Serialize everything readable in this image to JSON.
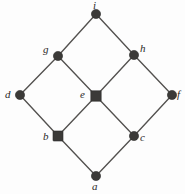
{
  "figure": {
    "width": 185,
    "height": 194,
    "background_color": "#fdfdfd",
    "edge_color": "#53514f",
    "node_color": "#3b3a38",
    "label_color": "#2b2a28"
  },
  "chart_data": {
    "type": "diagram",
    "subtype": "hasse-diagram",
    "title": "",
    "xlabel": "",
    "ylabel": "",
    "grid": false,
    "legend": null,
    "nodes": [
      {
        "id": "i",
        "label": "i",
        "x": 96,
        "y": 14,
        "shape": "circle",
        "radius": 4.6,
        "label_pos": "above",
        "label_x": 93,
        "label_y": 0
      },
      {
        "id": "g",
        "label": "g",
        "x": 58,
        "y": 56,
        "shape": "circle",
        "radius": 4.6,
        "label_pos": "left",
        "label_x": 43,
        "label_y": 44
      },
      {
        "id": "h",
        "label": "h",
        "x": 134,
        "y": 55,
        "shape": "circle",
        "radius": 4.6,
        "label_pos": "right",
        "label_x": 140,
        "label_y": 43
      },
      {
        "id": "d",
        "label": "d",
        "x": 20,
        "y": 95,
        "shape": "circle",
        "radius": 4.6,
        "label_pos": "left",
        "label_x": 5,
        "label_y": 89
      },
      {
        "id": "e",
        "label": "e",
        "x": 96,
        "y": 96,
        "shape": "square",
        "radius": 5.2,
        "label_pos": "left",
        "label_x": 80,
        "label_y": 89
      },
      {
        "id": "f",
        "label": "f",
        "x": 172,
        "y": 95,
        "shape": "circle",
        "radius": 4.6,
        "label_pos": "right",
        "label_x": 177,
        "label_y": 89
      },
      {
        "id": "b",
        "label": "b",
        "x": 58,
        "y": 136,
        "shape": "square",
        "radius": 5.0,
        "label_pos": "left",
        "label_x": 43,
        "label_y": 131
      },
      {
        "id": "c",
        "label": "c",
        "x": 134,
        "y": 136,
        "shape": "circle",
        "radius": 4.6,
        "label_pos": "right",
        "label_x": 140,
        "label_y": 132
      },
      {
        "id": "a",
        "label": "a",
        "x": 96,
        "y": 176,
        "shape": "circle",
        "radius": 4.6,
        "label_pos": "below",
        "label_x": 92,
        "label_y": 181
      }
    ],
    "edges": [
      {
        "from": "g",
        "to": "i"
      },
      {
        "from": "h",
        "to": "i"
      },
      {
        "from": "d",
        "to": "g"
      },
      {
        "from": "e",
        "to": "g"
      },
      {
        "from": "e",
        "to": "h"
      },
      {
        "from": "f",
        "to": "h"
      },
      {
        "from": "b",
        "to": "d"
      },
      {
        "from": "b",
        "to": "e"
      },
      {
        "from": "c",
        "to": "e"
      },
      {
        "from": "c",
        "to": "f"
      },
      {
        "from": "a",
        "to": "b"
      },
      {
        "from": "a",
        "to": "c"
      }
    ]
  }
}
